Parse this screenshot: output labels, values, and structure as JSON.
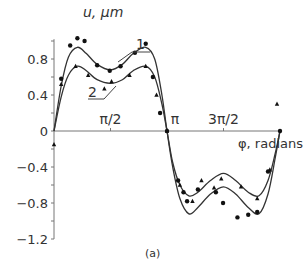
{
  "chart_data": {
    "type": "line",
    "title": "",
    "xlabel": "φ, radians",
    "ylabel": "u, μm",
    "caption": "(a)",
    "xlim": [
      0,
      6.2832
    ],
    "ylim": [
      -1.2,
      1.0
    ],
    "x_ticks": [
      {
        "value": 1.5708,
        "label": "π/2"
      },
      {
        "value": 3.1416,
        "label": "π"
      },
      {
        "value": 4.7124,
        "label": "3π/2"
      }
    ],
    "y_ticks": [
      {
        "value": 0.8,
        "label": "0.8"
      },
      {
        "value": 0.4,
        "label": "0.4"
      },
      {
        "value": 0,
        "label": "0"
      },
      {
        "value": -0.4,
        "label": "−0.4"
      },
      {
        "value": -0.8,
        "label": "−0.8"
      },
      {
        "value": -1.2,
        "label": "−1.2"
      }
    ],
    "grid": false,
    "legend": "inline curve labels '1' and '2' with leader lines",
    "series": [
      {
        "name": "1",
        "curve": [
          [
            0,
            0
          ],
          [
            0.2,
            0.5
          ],
          [
            0.4,
            0.82
          ],
          [
            0.65,
            0.93
          ],
          [
            0.9,
            0.86
          ],
          [
            1.2,
            0.74
          ],
          [
            1.57,
            0.68
          ],
          [
            1.9,
            0.74
          ],
          [
            2.2,
            0.86
          ],
          [
            2.55,
            0.93
          ],
          [
            2.8,
            0.8
          ],
          [
            3.0,
            0.4
          ],
          [
            3.1416,
            0
          ],
          [
            3.3,
            -0.4
          ],
          [
            3.5,
            -0.75
          ],
          [
            3.75,
            -0.92
          ],
          [
            4.0,
            -0.85
          ],
          [
            4.35,
            -0.7
          ],
          [
            4.71,
            -0.62
          ],
          [
            5.05,
            -0.7
          ],
          [
            5.4,
            -0.85
          ],
          [
            5.7,
            -0.92
          ],
          [
            5.95,
            -0.7
          ],
          [
            6.15,
            -0.3
          ],
          [
            6.2832,
            0
          ]
        ],
        "points": [
          [
            0.2,
            0.58
          ],
          [
            0.45,
            0.95
          ],
          [
            0.65,
            1.03
          ],
          [
            0.85,
            1.0
          ],
          [
            1.2,
            0.73
          ],
          [
            1.55,
            0.67
          ],
          [
            1.85,
            0.72
          ],
          [
            2.25,
            0.87
          ],
          [
            2.55,
            0.97
          ],
          [
            2.75,
            0.6
          ],
          [
            2.95,
            0.2
          ],
          [
            3.1416,
            0
          ],
          [
            3.45,
            -0.55
          ],
          [
            3.6,
            -0.68
          ],
          [
            3.7,
            -0.78
          ],
          [
            4.0,
            -0.65
          ],
          [
            4.5,
            -0.68
          ],
          [
            4.7,
            -0.8
          ],
          [
            5.1,
            -0.96
          ],
          [
            5.4,
            -0.93
          ],
          [
            5.65,
            -0.9
          ],
          [
            5.95,
            -0.45
          ],
          [
            6.2832,
            0
          ]
        ],
        "marker": "circle"
      },
      {
        "name": "2",
        "curve": [
          [
            0,
            0
          ],
          [
            0.2,
            0.38
          ],
          [
            0.4,
            0.62
          ],
          [
            0.65,
            0.72
          ],
          [
            0.9,
            0.67
          ],
          [
            1.2,
            0.57
          ],
          [
            1.57,
            0.53
          ],
          [
            1.9,
            0.57
          ],
          [
            2.2,
            0.67
          ],
          [
            2.55,
            0.72
          ],
          [
            2.8,
            0.6
          ],
          [
            3.0,
            0.3
          ],
          [
            3.1416,
            0
          ],
          [
            3.3,
            -0.35
          ],
          [
            3.5,
            -0.6
          ],
          [
            3.75,
            -0.72
          ],
          [
            4.0,
            -0.68
          ],
          [
            4.35,
            -0.55
          ],
          [
            4.71,
            -0.47
          ],
          [
            5.05,
            -0.55
          ],
          [
            5.4,
            -0.68
          ],
          [
            5.7,
            -0.72
          ],
          [
            5.95,
            -0.55
          ],
          [
            6.15,
            -0.25
          ],
          [
            6.2832,
            0
          ]
        ],
        "points": [
          [
            0.2,
            0.52
          ],
          [
            0.6,
            0.72
          ],
          [
            0.95,
            0.62
          ],
          [
            1.4,
            0.47
          ],
          [
            1.6,
            0.55
          ],
          [
            2.1,
            0.62
          ],
          [
            2.55,
            0.72
          ],
          [
            2.85,
            0.4
          ],
          [
            3.1416,
            0
          ],
          [
            3.5,
            -0.6
          ],
          [
            3.85,
            -0.78
          ],
          [
            4.1,
            -0.55
          ],
          [
            4.45,
            -0.63
          ],
          [
            4.65,
            -0.53
          ],
          [
            5.2,
            -0.62
          ],
          [
            5.65,
            -0.75
          ],
          [
            6.0,
            -0.43
          ],
          [
            6.2,
            0.3
          ],
          [
            0,
            -0.15
          ]
        ],
        "marker": "triangle"
      }
    ]
  },
  "labels": {
    "ylabel": "u, μm",
    "xlabel": "φ, radians",
    "caption": "(a)",
    "series_1": "1",
    "series_2": "2"
  }
}
